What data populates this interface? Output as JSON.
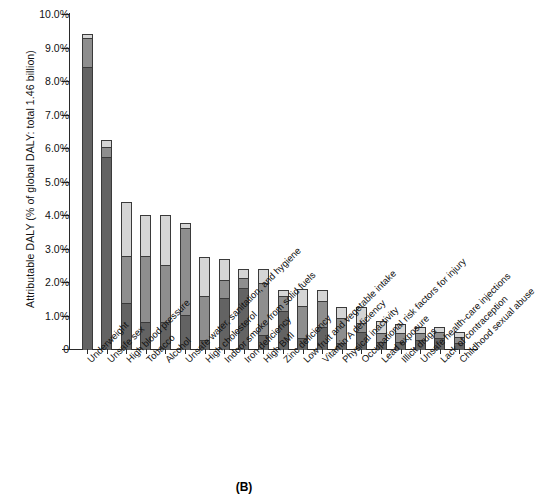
{
  "panel_caption": "(B)",
  "chart_data": {
    "type": "bar",
    "stacked": true,
    "title": "",
    "xlabel": "",
    "ylabel": "Attributable DALY (% of global DALY: total 1.46 billion)",
    "ylim": [
      0,
      10
    ],
    "ytick_labels": [
      "10.0%",
      "9.0%",
      "8.0%",
      "7.0%",
      "6.0%",
      "5.0%",
      "4.0%",
      "3.0%",
      "2.0%",
      "1.0%",
      "0"
    ],
    "ytick_values": [
      10,
      9,
      8,
      7,
      6,
      5,
      4,
      3,
      2,
      1,
      0
    ],
    "grid": false,
    "legend": "none",
    "categories": [
      "Underweight",
      "Unsafe sex",
      "High blood pressure",
      "Tobacco",
      "Alcohol",
      "Unsafe water, sanitation, and hygiene",
      "High cholesterol",
      "Indoor smoke from solid fuels",
      "Iron deficiency",
      "High BMI",
      "Zinc deficiency",
      "Low fruit and vegetable intake",
      "Vitamin A deficiency",
      "Physical inactivity",
      "Occupational risk factors for injury",
      "Lead exposure",
      "Illicit drugs",
      "Unsafe health-care injections",
      "Lack of contraception",
      "Childhood sexual abuse"
    ],
    "series": [
      {
        "name": "low-income countries",
        "color": "#636363",
        "values": [
          8.45,
          5.75,
          1.4,
          0.85,
          0.85,
          1.05,
          0.3,
          1.55,
          1.85,
          0.45,
          1.15,
          0.35,
          0.7,
          0.2,
          0.55,
          0.25,
          0.25,
          0.3,
          0.35,
          0.2
        ]
      },
      {
        "name": "middle-income countries",
        "color": "#8e8e8e",
        "values": [
          0.85,
          0.3,
          1.4,
          1.95,
          1.7,
          2.6,
          1.3,
          0.55,
          0.3,
          1.55,
          0.45,
          0.95,
          0.75,
          0.75,
          0.25,
          0.25,
          0.25,
          0.2,
          0.2,
          0.2
        ]
      },
      {
        "name": "high-income countries",
        "color": "#d5d5d5",
        "values": [
          0.1,
          0.2,
          1.6,
          1.2,
          1.45,
          0.1,
          1.15,
          0.6,
          0.25,
          0.4,
          0.15,
          0.5,
          0.3,
          0.3,
          0.45,
          0.35,
          0.25,
          0.15,
          0.1,
          0.1
        ]
      }
    ],
    "totals": [
      9.4,
      6.25,
      4.4,
      4.0,
      4.0,
      3.75,
      2.75,
      2.7,
      2.4,
      2.4,
      1.75,
      1.8,
      1.75,
      1.25,
      1.25,
      0.85,
      0.75,
      0.65,
      0.65,
      0.5
    ]
  }
}
